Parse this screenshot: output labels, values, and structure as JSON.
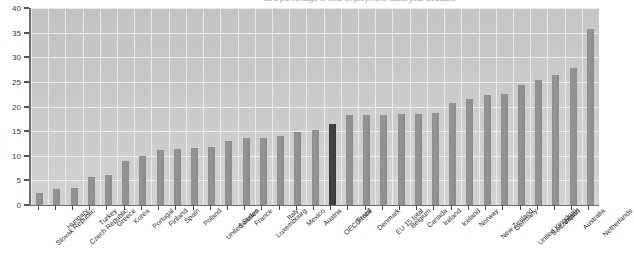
{
  "chart_data": {
    "type": "bar",
    "title": "as a percentage of total employment, latest year available",
    "xlabel": "",
    "ylabel": "",
    "ylim": [
      0,
      40
    ],
    "ytick_step": 5,
    "yticks": [
      0,
      5,
      10,
      15,
      20,
      25,
      30,
      35,
      40
    ],
    "grid": true,
    "legend": "none",
    "highlight_category": "OECD total",
    "bar_color": "#8e8e8e",
    "highlight_color": "#3b3b3b",
    "plot_background": "#cacaca",
    "gridline_color": "#f2f2f2",
    "categories": [
      "Slovak Republic",
      "Hungary",
      "Czech Republic",
      "Turkey",
      "Greece",
      "Korea",
      "Portugal",
      "Finland",
      "Spain",
      "Poland",
      "United States",
      "Sweden",
      "France",
      "Luxembourg",
      "Italy",
      "Mexico",
      "Austria",
      "OECD total",
      "Brazil",
      "Denmark",
      "EU 15 total",
      "Belgium",
      "Canada",
      "Ireland",
      "Iceland",
      "Norway",
      "New Zealand",
      "Germany",
      "United Kingdom",
      "Switzerland",
      "Japan",
      "Australia",
      "Netherlands"
    ],
    "values": [
      2.5,
      3.3,
      3.4,
      5.7,
      6.1,
      9.0,
      10.0,
      11.2,
      11.3,
      11.5,
      11.8,
      12.9,
      13.6,
      13.7,
      14.1,
      14.9,
      15.2,
      16.4,
      18.2,
      18.3,
      18.3,
      18.4,
      18.5,
      18.6,
      20.8,
      21.6,
      22.3,
      22.6,
      24.3,
      25.3,
      26.5,
      27.8,
      35.8
    ]
  }
}
